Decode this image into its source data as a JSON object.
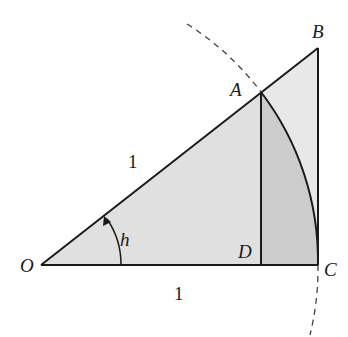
{
  "diagram": {
    "points": {
      "O": {
        "label": "O",
        "x": 41,
        "y": 265
      },
      "A": {
        "label": "A",
        "x": 261,
        "y": 92
      },
      "B": {
        "label": "B",
        "x": 318,
        "y": 48
      },
      "C": {
        "label": "C",
        "x": 318,
        "y": 265
      },
      "D": {
        "label": "D",
        "x": 261,
        "y": 265
      }
    },
    "labels": {
      "hyp_length": "1",
      "base_length": "1",
      "angle": "h"
    },
    "colors": {
      "stroke": "#1a1a1a",
      "light_fill": "#e6e6e6",
      "mid_fill": "#d9d9d9",
      "dark_fill": "#c9c9c9",
      "dash": "#444444"
    }
  }
}
